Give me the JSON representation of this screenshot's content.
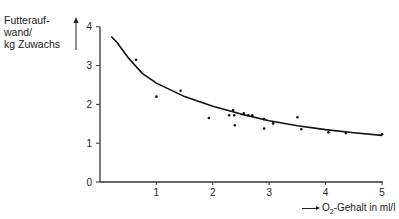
{
  "chart_data": {
    "type": "scatter",
    "title": "",
    "ylabel": [
      "Futterauf-",
      "wand/",
      "kg Zuwachs"
    ],
    "xlabel": "O2-Gehalt in ml/l",
    "xlabel_parts": {
      "pre": "O",
      "sub": "2",
      "post": "-Gehalt in ml/l"
    },
    "xlim": [
      0,
      5
    ],
    "ylim": [
      0,
      4
    ],
    "x_ticks": [
      1,
      2,
      3,
      4,
      5
    ],
    "y_ticks": [
      0,
      1,
      2,
      3,
      4
    ],
    "grid": false,
    "legend": null,
    "series": [
      {
        "name": "Messwerte",
        "kind": "scatter",
        "points": [
          [
            0.64,
            3.15
          ],
          [
            1.0,
            2.2
          ],
          [
            1.43,
            2.35
          ],
          [
            1.93,
            1.65
          ],
          [
            2.29,
            1.72
          ],
          [
            2.36,
            1.85
          ],
          [
            2.38,
            1.72
          ],
          [
            2.39,
            1.46
          ],
          [
            2.55,
            1.77
          ],
          [
            2.63,
            1.72
          ],
          [
            2.7,
            1.72
          ],
          [
            2.91,
            1.62
          ],
          [
            2.91,
            1.38
          ],
          [
            3.07,
            1.51
          ],
          [
            3.5,
            1.67
          ],
          [
            3.57,
            1.36
          ],
          [
            4.05,
            1.28
          ],
          [
            4.36,
            1.26
          ],
          [
            5.0,
            1.23
          ]
        ]
      },
      {
        "name": "Ausgleichskurve",
        "kind": "line",
        "points": [
          [
            0.2,
            3.75
          ],
          [
            0.3,
            3.6
          ],
          [
            0.5,
            3.2
          ],
          [
            0.75,
            2.8
          ],
          [
            1.0,
            2.55
          ],
          [
            1.5,
            2.2
          ],
          [
            2.0,
            1.95
          ],
          [
            2.5,
            1.75
          ],
          [
            3.0,
            1.58
          ],
          [
            3.5,
            1.45
          ],
          [
            4.0,
            1.35
          ],
          [
            4.5,
            1.27
          ],
          [
            5.0,
            1.2
          ]
        ]
      }
    ]
  },
  "colors": {
    "ink": "#222222",
    "background": "#ffffff"
  }
}
